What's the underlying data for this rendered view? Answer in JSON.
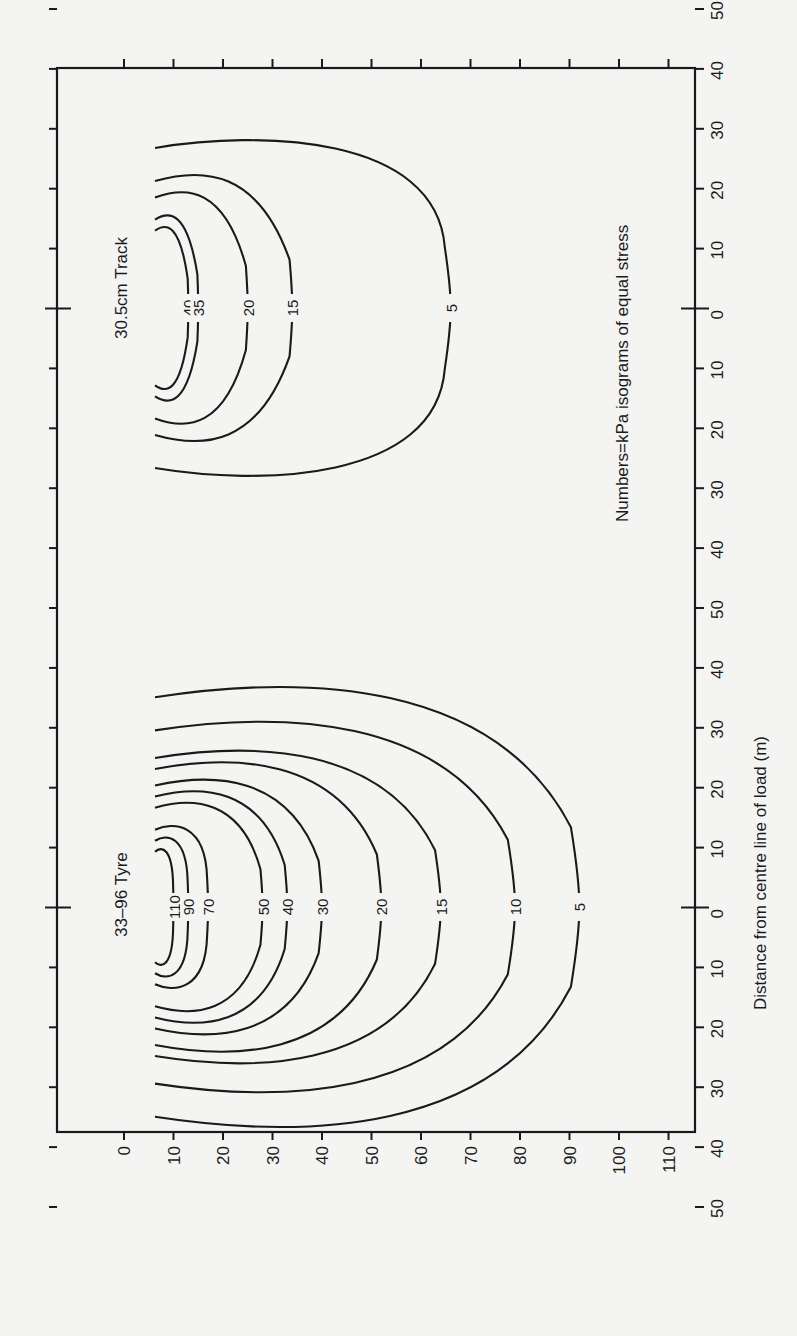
{
  "chart_data": {
    "type": "contour",
    "title": "",
    "orientation_note": "Figure is printed rotated 90° clockwise: depth runs along the bottom edge, distance along the right edge.",
    "annotation": "Numbers = kPa isograms of equal stress",
    "xlabel": "Distance from centre line of load (m)",
    "ylabel": "",
    "depth_axis": {
      "ticks": [
        0,
        10,
        20,
        30,
        40,
        50,
        60,
        70,
        80,
        90,
        100,
        110
      ],
      "tick_labels": [
        "0",
        "10",
        "20",
        "30",
        "40",
        "50",
        "60",
        "70",
        "80",
        "90",
        "100",
        "110"
      ],
      "range": [
        0,
        115
      ]
    },
    "distance_axis": {
      "tick_labels": [
        "50",
        "40",
        "30",
        "20",
        "10",
        "0",
        "10",
        "20",
        "30",
        "40",
        "50",
        "40",
        "30",
        "20",
        "10",
        "0",
        "10",
        "20",
        "30",
        "40",
        "50"
      ],
      "panels": 2
    },
    "series": [
      {
        "name": "33–96 Tyre",
        "label": "33–96 Tyre",
        "isograms_kPa": [
          110,
          90,
          70,
          50,
          40,
          30,
          20,
          15,
          10,
          5
        ],
        "max_depth_cm": [
          10,
          13,
          17,
          28,
          33,
          40,
          52,
          64,
          79,
          92
        ],
        "half_width_m": [
          10,
          12,
          14,
          18,
          20,
          22,
          25,
          27,
          32,
          38
        ]
      },
      {
        "name": "30.5cm Track",
        "label": "30.5cm Track",
        "isograms_kPa": [
          40,
          35,
          20,
          15,
          5
        ],
        "max_depth_cm": [
          13,
          15,
          25,
          34,
          66
        ],
        "half_width_m": [
          14,
          16,
          20,
          23,
          29
        ]
      }
    ]
  },
  "labels": {
    "tyre": "33–96 Tyre",
    "track": "30.5cm Track",
    "annotation": "Numbers=kPa isograms of equal stress",
    "distance_axis_title": "Distance from centre line of load (m)"
  }
}
